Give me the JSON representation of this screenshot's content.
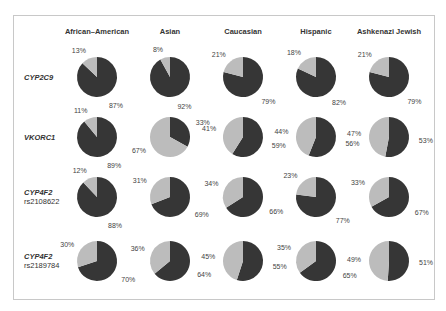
{
  "chart_data": {
    "type": "pie",
    "title": "",
    "layout": "grid of pie charts (rows = genes, columns = populations)",
    "colors": {
      "major": "#363636",
      "minor": "#bcbcbc"
    },
    "columns": [
      "African–American",
      "Asian",
      "Caucasian",
      "Hispanic",
      "Ashkenazi Jewish"
    ],
    "rows": [
      {
        "gene": "CYP2C9",
        "snp": "",
        "pies": [
          {
            "population": "African–American",
            "dark": 87,
            "light": 13
          },
          {
            "population": "Asian",
            "dark": 92,
            "light": 8
          },
          {
            "population": "Caucasian",
            "dark": 79,
            "light": 21
          },
          {
            "population": "Hispanic",
            "dark": 82,
            "light": 18
          },
          {
            "population": "Ashkenazi Jewish",
            "dark": 79,
            "light": 21
          }
        ]
      },
      {
        "gene": "VKORC1",
        "snp": "",
        "pies": [
          {
            "population": "African–American",
            "dark": 89,
            "light": 11
          },
          {
            "population": "Asian",
            "dark": 33,
            "light": 67
          },
          {
            "population": "Caucasian",
            "dark": 59,
            "light": 41
          },
          {
            "population": "Hispanic",
            "dark": 56,
            "light": 44
          },
          {
            "population": "Ashkenazi Jewish",
            "dark": 53,
            "light": 47
          }
        ]
      },
      {
        "gene": "CYP4F2",
        "snp": "rs2108622",
        "pies": [
          {
            "population": "African–American",
            "dark": 88,
            "light": 12
          },
          {
            "population": "Asian",
            "dark": 69,
            "light": 31
          },
          {
            "population": "Caucasian",
            "dark": 66,
            "light": 34
          },
          {
            "population": "Hispanic",
            "dark": 77,
            "light": 23
          },
          {
            "population": "Ashkenazi Jewish",
            "dark": 67,
            "light": 33
          }
        ]
      },
      {
        "gene": "CYP4F2",
        "snp": "rs2189784",
        "pies": [
          {
            "population": "African–American",
            "dark": 70,
            "light": 30
          },
          {
            "population": "Asian",
            "dark": 64,
            "light": 36
          },
          {
            "population": "Caucasian",
            "dark": 55,
            "light": 45
          },
          {
            "population": "Hispanic",
            "dark": 65,
            "light": 35
          },
          {
            "population": "Ashkenazi Jewish",
            "dark": 51,
            "light": 49
          }
        ]
      }
    ]
  }
}
